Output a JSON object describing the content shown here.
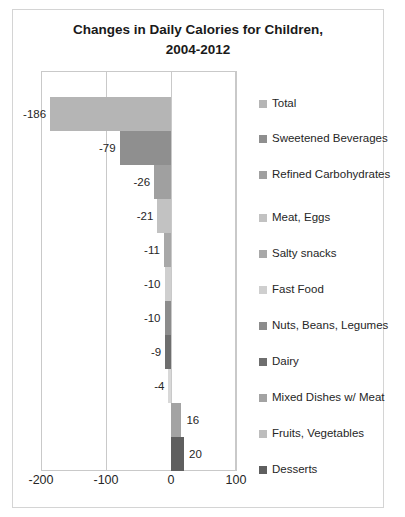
{
  "chart_data": {
    "type": "bar",
    "orientation": "horizontal",
    "title": "Changes in Daily Calories for Children, 2004-2012",
    "title_lines": [
      "Changes in Daily Calories for Children,",
      "2004-2012"
    ],
    "xlabel": "",
    "ylabel": "",
    "xlim": [
      -200,
      100
    ],
    "xticks": [
      "-200",
      "-100",
      "0",
      "100"
    ],
    "xtick_values": [
      -200,
      -100,
      0,
      100
    ],
    "grid": true,
    "legend_position": "right",
    "categories": [
      "Total",
      "Sweetened Beverages",
      "Refined Carbohydrates",
      "Meat, Eggs",
      "Salty snacks",
      "Fast Food",
      "Nuts, Beans, Legumes",
      "Dairy",
      "Mixed Dishes w/ Meat",
      "Fruits, Vegetables",
      "Desserts"
    ],
    "values": [
      -186,
      -79,
      -26,
      -21,
      -11,
      -10,
      -10,
      -9,
      -4,
      16,
      20
    ],
    "data_labels": [
      "-186",
      "-79",
      "-26",
      "-21",
      "-11",
      "-10",
      "-10",
      "-9",
      "-4",
      "16",
      "20"
    ],
    "colors": [
      "#b5b5b5",
      "#8f8f8f",
      "#a0a0a0",
      "#c2c2c2",
      "#a8a8a8",
      "#cfcfcf",
      "#8c8c8c",
      "#6e6e6e",
      "#d8d8d8",
      "#a3a3a3",
      "#5f5f5f"
    ]
  },
  "legend": {
    "items": [
      {
        "label": "Total",
        "color": "#b5b5b5",
        "top": 12
      },
      {
        "label": "Sweetened Beverages",
        "color": "#8f8f8f",
        "top": 47
      },
      {
        "label": "Refined Carbohydrates",
        "color": "#a0a0a0",
        "top": 83
      },
      {
        "label": "Meat, Eggs",
        "color": "#c2c2c2",
        "top": 126
      },
      {
        "label": "Salty snacks",
        "color": "#a8a8a8",
        "top": 162
      },
      {
        "label": "Fast Food",
        "color": "#cfcfcf",
        "top": 198
      },
      {
        "label": "Nuts, Beans, Legumes",
        "color": "#8c8c8c",
        "top": 234
      },
      {
        "label": "Dairy",
        "color": "#6e6e6e",
        "top": 270
      },
      {
        "label": "Mixed Dishes w/ Meat",
        "color": "#a3a3a3",
        "top": 306
      },
      {
        "label": "Fruits, Vegetables",
        "color": "#bdbdbd",
        "top": 342
      },
      {
        "label": "Desserts",
        "color": "#5f5f5f",
        "top": 378
      }
    ]
  }
}
